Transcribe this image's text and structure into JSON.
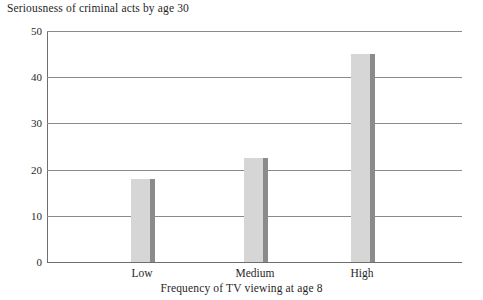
{
  "chart_data": {
    "type": "bar",
    "title": "Seriousness of criminal acts by age 30",
    "xlabel": "Frequency of TV viewing at age 8",
    "ylabel": "",
    "categories": [
      "Low",
      "Medium",
      "High"
    ],
    "values": [
      18,
      22.5,
      45
    ],
    "ylim": [
      0,
      50
    ],
    "yticks": [
      0,
      10,
      20,
      30,
      40,
      50
    ],
    "ytick_labels": [
      "0",
      "10",
      "20",
      "30",
      "40",
      "50"
    ],
    "grid": true,
    "legend": false,
    "series": [
      {
        "name": "Seriousness of criminal acts by age 30",
        "values": [
          18,
          22.5,
          45
        ]
      }
    ],
    "colors": {
      "bar_fill": "#d6d6d6",
      "bar_shadow": "#8b8b8b",
      "gridline": "#8a8a8a",
      "axis": "#6e6e6e",
      "text": "#1f1f1f",
      "background": "#ffffff"
    }
  }
}
